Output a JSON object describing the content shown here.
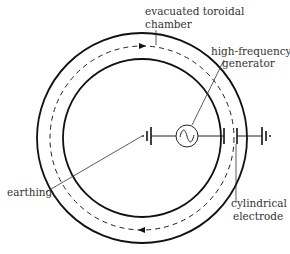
{
  "diagram": {
    "type": "betatron / toroidal accelerator schematic",
    "labels": {
      "chamber_line1": "evacuated toroidal",
      "chamber_line2": "chamber",
      "generator_line1": "high-frequency",
      "generator_line2": "generator",
      "earthing": "earthing",
      "electrode_line1": "cylindrical",
      "electrode_line2": "electrode"
    },
    "components": [
      "outer-wall",
      "inner-wall",
      "particle-path",
      "ac-source",
      "capacitor-plates",
      "earth-grounds"
    ],
    "path_direction": "clockwise"
  }
}
